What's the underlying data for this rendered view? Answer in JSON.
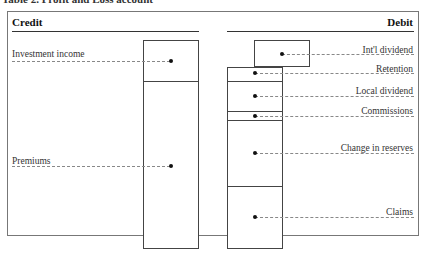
{
  "title": "Table 2. Profit and Loss account",
  "credit": {
    "header": "Credit",
    "items": [
      {
        "label": "Investment income"
      },
      {
        "label": "Premiums"
      }
    ]
  },
  "debit": {
    "header": "Debit",
    "items": [
      {
        "label": "Int'l dividend"
      },
      {
        "label": "Retention"
      },
      {
        "label": "Local dividend"
      },
      {
        "label": "Commissions"
      },
      {
        "label": "Change in reserves"
      },
      {
        "label": "Claims"
      }
    ]
  }
}
